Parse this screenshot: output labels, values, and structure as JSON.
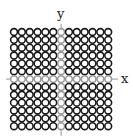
{
  "diagram": {
    "type": "circle-lattice-on-axes",
    "axes": {
      "x_label": "x",
      "y_label": "y",
      "color": "#999999"
    },
    "grid": {
      "rows": 13,
      "cols": 13,
      "circle_stroke": "#1a1a1a",
      "axis_circle_stroke": "#9a9a9a",
      "fill": "#ffffff"
    }
  }
}
